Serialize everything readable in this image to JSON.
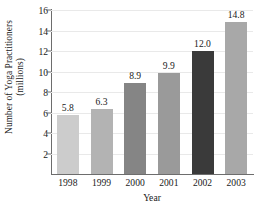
{
  "chart_data": {
    "type": "bar",
    "title": "",
    "xlabel": "Year",
    "ylabel_lines": [
      "Number of Yoga Practitioners",
      "(millions)"
    ],
    "ylabel": "Number of Yoga Practitioners (millions)",
    "categories": [
      "1998",
      "1999",
      "2000",
      "2001",
      "2002",
      "2003"
    ],
    "values": [
      5.8,
      6.3,
      8.9,
      9.9,
      12.0,
      14.8
    ],
    "value_labels": [
      "5.8",
      "6.3",
      "8.9",
      "9.9",
      "12.0",
      "14.8"
    ],
    "bar_colors": [
      "#cccccc",
      "#b3b3b3",
      "#858585",
      "#9a9a9a",
      "#3a3a3a",
      "#a8a8a8"
    ],
    "ylim": [
      0,
      16
    ],
    "yticks": [
      2,
      4,
      6,
      8,
      10,
      12,
      14,
      16
    ],
    "ytick_labels": [
      "2",
      "4",
      "6",
      "8",
      "10",
      "12",
      "14",
      "16"
    ],
    "grid": true,
    "grid_axis": "y",
    "legend": "none",
    "axis_color": "#6d6d6d",
    "gridline_color": "#e9e9e9",
    "background": "#ffffff"
  }
}
